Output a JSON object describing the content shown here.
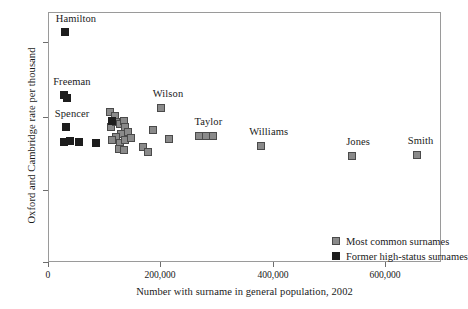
{
  "chart_data": {
    "type": "scatter",
    "title": "",
    "xlabel": "Number with surname in general population, 2002",
    "ylabel": "Oxford and Cambridge rate per thousand",
    "xlim": [
      0,
      700000
    ],
    "ylim": [
      0,
      6.6
    ],
    "xticks": [
      0,
      200000,
      400000,
      600000
    ],
    "xtick_labels": [
      "0",
      "200,000",
      "400,000",
      "600,000"
    ],
    "yticks": [
      0,
      2,
      4,
      6
    ],
    "ytick_labels": [
      "0",
      "2",
      "4",
      "6"
    ],
    "grid": false,
    "legend_position": "lower right",
    "colors": {
      "common": "#8a8a8a",
      "common_edge": "#4a4a4a",
      "highstatus": "#1d1d1d",
      "frame": "#9a9a9a",
      "text": "#1a1a1a"
    },
    "series": [
      {
        "name": "Most common surnames",
        "marker": "square-filled-gray",
        "points": [
          {
            "x": 108000,
            "y": 3.98,
            "label": ""
          },
          {
            "x": 118000,
            "y": 3.88,
            "label": ""
          },
          {
            "x": 110000,
            "y": 3.6,
            "label": ""
          },
          {
            "x": 120000,
            "y": 3.72,
            "label": ""
          },
          {
            "x": 127000,
            "y": 3.66,
            "label": ""
          },
          {
            "x": 133000,
            "y": 3.74,
            "label": ""
          },
          {
            "x": 136000,
            "y": 3.58,
            "label": ""
          },
          {
            "x": 141000,
            "y": 3.46,
            "label": ""
          },
          {
            "x": 128000,
            "y": 3.4,
            "label": ""
          },
          {
            "x": 119000,
            "y": 3.32,
            "label": ""
          },
          {
            "x": 112000,
            "y": 3.24,
            "label": ""
          },
          {
            "x": 126000,
            "y": 3.18,
            "label": ""
          },
          {
            "x": 136000,
            "y": 3.26,
            "label": ""
          },
          {
            "x": 146000,
            "y": 3.3,
            "label": ""
          },
          {
            "x": 124000,
            "y": 3.02,
            "label": ""
          },
          {
            "x": 134000,
            "y": 2.98,
            "label": ""
          },
          {
            "x": 167000,
            "y": 3.06,
            "label": ""
          },
          {
            "x": 176000,
            "y": 2.92,
            "label": ""
          },
          {
            "x": 186000,
            "y": 3.52,
            "label": ""
          },
          {
            "x": 199000,
            "y": 4.08,
            "label": "Wilson"
          },
          {
            "x": 213000,
            "y": 3.28,
            "label": ""
          },
          {
            "x": 268000,
            "y": 3.34,
            "label": "Taylor"
          },
          {
            "x": 280000,
            "y": 3.34,
            "label": ""
          },
          {
            "x": 292000,
            "y": 3.36,
            "label": ""
          },
          {
            "x": 378000,
            "y": 3.1,
            "label": "Williams"
          },
          {
            "x": 540000,
            "y": 2.82,
            "label": "Jones"
          },
          {
            "x": 655000,
            "y": 2.84,
            "label": "Smith"
          }
        ]
      },
      {
        "name": "Former high-status surnames",
        "marker": "square-filled-black",
        "points": [
          {
            "x": 28000,
            "y": 6.1,
            "label": "Hamilton"
          },
          {
            "x": 27000,
            "y": 4.44,
            "label": "Freeman"
          },
          {
            "x": 32000,
            "y": 4.36,
            "label": ""
          },
          {
            "x": 30000,
            "y": 3.58,
            "label": "Spencer"
          },
          {
            "x": 27000,
            "y": 3.2,
            "label": ""
          },
          {
            "x": 37000,
            "y": 3.22,
            "label": ""
          },
          {
            "x": 53000,
            "y": 3.2,
            "label": ""
          },
          {
            "x": 84000,
            "y": 3.18,
            "label": ""
          },
          {
            "x": 112000,
            "y": 3.74,
            "label": ""
          }
        ]
      }
    ],
    "annotations": [
      {
        "text": "Hamilton",
        "x": 28000,
        "y": 6.1
      },
      {
        "text": "Freeman",
        "x": 27000,
        "y": 4.44
      },
      {
        "text": "Spencer",
        "x": 30000,
        "y": 3.58
      },
      {
        "text": "Wilson",
        "x": 199000,
        "y": 4.08
      },
      {
        "text": "Taylor",
        "x": 268000,
        "y": 3.34
      },
      {
        "text": "Williams",
        "x": 378000,
        "y": 3.1
      },
      {
        "text": "Jones",
        "x": 540000,
        "y": 2.82
      },
      {
        "text": "Smith",
        "x": 655000,
        "y": 2.84
      }
    ],
    "legend_entries": [
      {
        "label": "Most common surnames",
        "swatch": "common"
      },
      {
        "label": "Former high-status surnames",
        "swatch": "highstatus"
      }
    ]
  },
  "axis": {
    "ylabel": "Oxford and Cambridge rate per thousand",
    "xlabel": "Number with surname in general population, 2002",
    "ytick_labels": [
      "6",
      "4",
      "2",
      "0"
    ],
    "xtick_labels": [
      "0",
      "200,000",
      "400,000",
      "600,000"
    ]
  },
  "legend": {
    "row0_label": "Most common surnames",
    "row1_label": "Former high-status surnames"
  },
  "labels": {
    "hamilton": "Hamilton",
    "freeman": "Freeman",
    "spencer": "Spencer",
    "wilson": "Wilson",
    "taylor": "Taylor",
    "williams": "Williams",
    "jones": "Jones",
    "smith": "Smith"
  }
}
